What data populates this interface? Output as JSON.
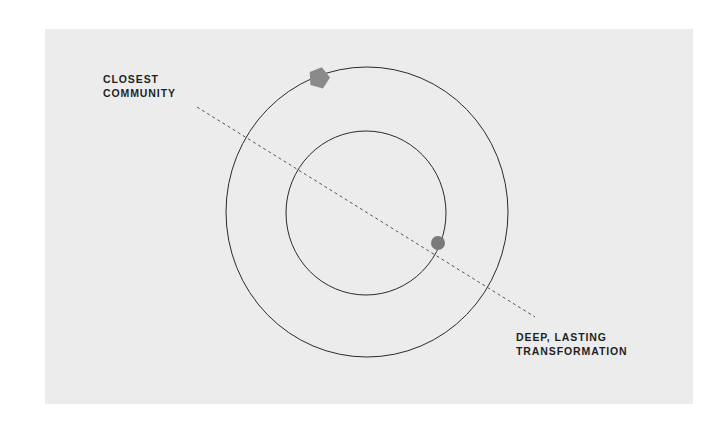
{
  "diagram": {
    "labels": {
      "closest": {
        "line1": "CLOSEST",
        "line2": "COMMUNITY"
      },
      "deep": {
        "line1": "DEEP, LASTING",
        "line2": "TRANSFORMATION"
      }
    },
    "shapes": {
      "outer_circle": {
        "cx": 367,
        "cy": 212,
        "rx": 141,
        "ry": 145
      },
      "inner_circle": {
        "cx": 366,
        "cy": 213,
        "rx": 80,
        "ry": 82
      },
      "axis_line": {
        "x1": 197,
        "y1": 107,
        "x2": 535,
        "y2": 317,
        "style": "dashed"
      },
      "pentagon_marker": {
        "cx": 319,
        "cy": 78,
        "size": 11,
        "color": "#8a8a8a"
      },
      "dot_marker": {
        "cx": 438,
        "cy": 243,
        "r": 7,
        "color": "#7a7a7a"
      }
    },
    "colors": {
      "panel": "#ececec",
      "stroke": "#2b2b2b",
      "text": "#1f1f1f"
    }
  }
}
